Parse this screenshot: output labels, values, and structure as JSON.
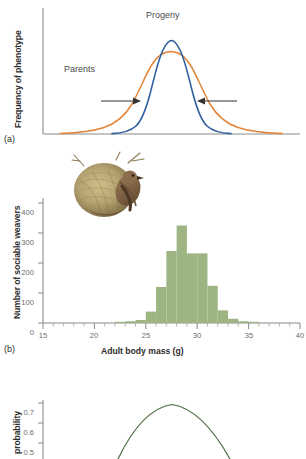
{
  "figure": {
    "panels": [
      {
        "letter": "(a)",
        "ylabel": "Frequency of phenotype",
        "labels": [
          {
            "name": "progeny",
            "text": "Progeny"
          },
          {
            "name": "parents",
            "text": "Parents"
          }
        ]
      },
      {
        "letter": "(b)",
        "ylabel": "Number of sociable weavers",
        "xlabel": "Adult body mass (g)"
      },
      {
        "letter": "",
        "ylabel": "probability"
      }
    ]
  },
  "colors": {
    "progeny_curve": "#2E5E9E",
    "parents_curve": "#E2873C",
    "histogram_bar": "#9DB583",
    "axis": "#8a8a8a",
    "arrow": "#333333",
    "probability_curve": "#4A6B42",
    "tick_text": "#6d6d6d",
    "label_text": "#2d2d2d"
  },
  "chart_data": [
    {
      "type": "line",
      "panel": "a",
      "title": "",
      "xlabel": "",
      "ylabel": "Frequency of phenotype",
      "grid": false,
      "legend": "inline-annotations",
      "axis_ticks_shown": false,
      "annotations": [
        {
          "text": "Progeny",
          "x": 0.5,
          "y": 1.0
        },
        {
          "text": "Parents",
          "x": 0.25,
          "y": 0.55
        },
        {
          "text": "arrow-left-inward",
          "direction": "right"
        },
        {
          "text": "arrow-right-inward",
          "direction": "left"
        }
      ],
      "series": [
        {
          "name": "Progeny",
          "color": "#2E5E9E",
          "distribution": "normal",
          "mean": 0.5,
          "sd": 0.072,
          "peak": 1.0,
          "description": "narrow tall blue normal curve centred on mean phenotype"
        },
        {
          "name": "Parents",
          "color": "#E2873C",
          "distribution": "normal",
          "mean": 0.5,
          "sd": 0.135,
          "peak": 0.78,
          "description": "broad lower orange normal curve centred on same mean"
        }
      ]
    },
    {
      "type": "bar",
      "panel": "b",
      "title": "",
      "xlabel": "Adult body mass (g)",
      "ylabel": "Number of sociable weavers",
      "xlim": [
        15,
        40
      ],
      "ylim": [
        0,
        400
      ],
      "xticks": [
        15,
        20,
        25,
        30,
        35,
        40
      ],
      "yticks": [
        0,
        100,
        200,
        300,
        400
      ],
      "xtick_labels": [
        "15",
        "20",
        "25",
        "30",
        "35",
        "40"
      ],
      "ytick_labels": [
        "0",
        "100",
        "200",
        "300",
        "400"
      ],
      "minor_xtick_interval": 1,
      "grid": false,
      "bin_width": 1,
      "bar_color": "#9DB583",
      "categories": [
        "22-23",
        "23-24",
        "24-25",
        "25-26",
        "26-27",
        "27-28",
        "28-29",
        "29-30",
        "30-31",
        "31-32",
        "32-33",
        "33-34",
        "34-35",
        "35-36"
      ],
      "bin_starts": [
        22,
        23,
        24,
        25,
        26,
        27,
        28,
        29,
        30,
        31,
        32,
        33,
        34,
        35
      ],
      "values": [
        4,
        6,
        10,
        38,
        120,
        240,
        325,
        232,
        232,
        124,
        42,
        14,
        6,
        4
      ]
    },
    {
      "type": "line",
      "panel": "c",
      "title": "",
      "xlabel": "",
      "ylabel": "probability",
      "ylim": [
        0.5,
        0.7
      ],
      "yticks": [
        0.5,
        0.6,
        0.7
      ],
      "ytick_labels": [
        "0.7",
        "0.6",
        "0.5"
      ],
      "grid": false,
      "cropped": true,
      "series": [
        {
          "name": "survival probability",
          "color": "#4A6B42",
          "shape": "concave-down parabola",
          "peak_y": 0.705,
          "description": "inverted-U fitness curve, partially cut off at bottom of image"
        }
      ]
    }
  ]
}
